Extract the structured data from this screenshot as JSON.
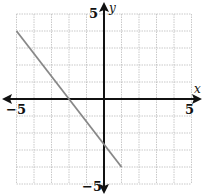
{
  "chart_data": {
    "type": "line",
    "title": "",
    "xlabel": "x",
    "ylabel": "y",
    "xlim": [
      -5,
      5
    ],
    "ylim": [
      -5,
      5
    ],
    "grid": true,
    "grid_step": 1,
    "x_tick_labels": [
      {
        "value": -5,
        "label": "−5"
      },
      {
        "value": 5,
        "label": "5"
      }
    ],
    "y_tick_labels": [
      {
        "value": 5,
        "label": "5"
      },
      {
        "value": -5,
        "label": "−5"
      }
    ],
    "series": [
      {
        "name": "segment",
        "x": [
          -5,
          1
        ],
        "y": [
          4,
          -4
        ],
        "color": "#888888"
      }
    ],
    "axis_color": "#111111",
    "grid_color": "#bbbbbb"
  }
}
